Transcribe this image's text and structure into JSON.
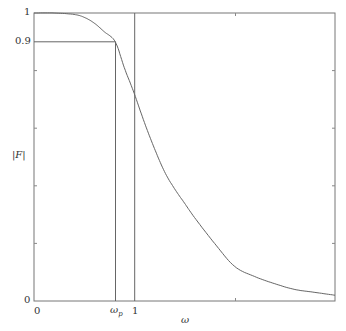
{
  "chart_data": {
    "type": "line",
    "title": "",
    "xlabel": "ω",
    "ylabel": "|F|",
    "xlim": [
      0,
      3
    ],
    "ylim": [
      0,
      1
    ],
    "x_ticks": [
      {
        "value": 0,
        "label": "0"
      },
      {
        "value": 0.81,
        "label": "ωp"
      },
      {
        "value": 1,
        "label": "1"
      },
      {
        "value": 2,
        "label": ""
      }
    ],
    "y_ticks": [
      {
        "value": 0,
        "label": "0"
      },
      {
        "value": 0.2,
        "label": ""
      },
      {
        "value": 0.4,
        "label": ""
      },
      {
        "value": 0.6,
        "label": ""
      },
      {
        "value": 0.8,
        "label": ""
      },
      {
        "value": 0.9,
        "label": "0.9"
      },
      {
        "value": 1,
        "label": "1"
      }
    ],
    "grid": false,
    "legend": null,
    "series": [
      {
        "name": "|F(ω)|",
        "x": [
          0,
          0.2,
          0.4,
          0.5,
          0.6,
          0.7,
          0.81,
          0.9,
          1.0,
          1.1,
          1.2,
          1.3,
          1.4,
          1.5,
          1.6,
          1.8,
          2.0,
          2.2,
          2.4,
          2.6,
          2.8,
          3.0
        ],
        "values": [
          1.0,
          1.0,
          0.995,
          0.985,
          0.965,
          0.935,
          0.9,
          0.81,
          0.72,
          0.62,
          0.53,
          0.45,
          0.39,
          0.34,
          0.29,
          0.2,
          0.12,
          0.085,
          0.06,
          0.04,
          0.03,
          0.02
        ]
      }
    ],
    "annotations": [
      {
        "type": "hline",
        "y": 0.9,
        "x_to": 0.81,
        "label": "0.9"
      },
      {
        "type": "vline",
        "x": 0.81,
        "y_to": 0.9,
        "label": "ωp"
      },
      {
        "type": "vline",
        "x": 1,
        "y_to": 1,
        "label": "1"
      }
    ]
  },
  "labels": {
    "y_top": "1",
    "y_09": "0.9",
    "y_zero": "0",
    "x_zero": "0",
    "x_wp_main": "ω",
    "x_wp_sub": "p",
    "x_one": "1",
    "x_axis": "ω",
    "y_axis": "|F|"
  }
}
